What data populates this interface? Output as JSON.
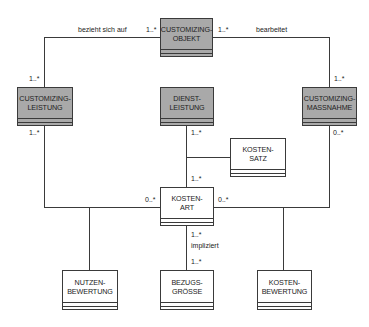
{
  "diagram": {
    "type": "uml-class-diagram",
    "colors": {
      "gray_box": "#a9a9a9",
      "white_box": "#ffffff",
      "line": "#3a3a3a"
    },
    "classes": {
      "customizing_objekt": {
        "label": "CUSTOMIZING-\nOBJEKT",
        "style": "gray"
      },
      "customizing_leistung": {
        "label": "CUSTOMIZING-\nLEISTUNG",
        "style": "gray"
      },
      "dienst_leistung": {
        "label": "DIENST-\nLEISTUNG",
        "style": "gray"
      },
      "customizing_massnahme": {
        "label": "CUSTOMIZING-\nMASSNAHME",
        "style": "gray"
      },
      "kosten_satz": {
        "label": "KOSTEN-\nSATZ",
        "style": "white"
      },
      "kosten_art": {
        "label": "KOSTEN-\nART",
        "style": "white"
      },
      "nutzen_bewertung": {
        "label": "NUTZEN-\nBEWERTUNG",
        "style": "white"
      },
      "bezugs_groesse": {
        "label": "BEZUGS-\nGRÖSSE",
        "style": "white"
      },
      "kosten_bewertung": {
        "label": "KOSTEN-\nBEWERTUNG",
        "style": "white"
      }
    },
    "associations": {
      "bezieht_sich_auf": {
        "label": "bezieht sich auf",
        "from": "CUSTOMIZING-LEISTUNG",
        "to": "CUSTOMIZING-OBJEKT",
        "mult_from": "1..*",
        "mult_to": "1..*"
      },
      "bearbeitet": {
        "label": "bearbeitet",
        "from": "CUSTOMIZING-OBJEKT",
        "to": "CUSTOMIZING-MASSNAHME",
        "mult_from": "1..*",
        "mult_to": "1..*"
      },
      "leistung_kostenart": {
        "from": "CUSTOMIZING-LEISTUNG",
        "to": "KOSTEN-ART",
        "mult_from": "1..*",
        "mult_to": "0..*"
      },
      "massnahme_kostenart": {
        "from": "CUSTOMIZING-MASSNAHME",
        "to": "KOSTEN-ART",
        "mult_from": "0..*",
        "mult_to": "0..*"
      },
      "dienstleistung_kostenart": {
        "from": "DIENST-LEISTUNG",
        "to": "KOSTEN-ART",
        "mult_from": "1..*",
        "mult_to": "1..*",
        "association_class": "KOSTEN-SATZ"
      },
      "impliziert": {
        "label": "impliziert",
        "from": "KOSTEN-ART",
        "to": "BEZUGS-GRÖSSE",
        "mult_from": "1..*",
        "mult_to": "1..*"
      }
    },
    "labels": {
      "bezieht_sich_auf": "bezieht sich auf",
      "bearbeitet": "bearbeitet",
      "impliziert": "impliziert",
      "m_co_left": "1..*",
      "m_co_right": "1..*",
      "m_cl_top": "1..*",
      "m_cm_top": "1..*",
      "m_cl_bottom": "1..*",
      "m_cm_bottom": "0..*",
      "m_dl_bottom": "1..*",
      "m_ka_top": "1..*",
      "m_ka_left": "0..*",
      "m_ka_right": "0..*",
      "m_ka_bottom": "1..*",
      "m_bg_top": "1..*"
    }
  }
}
